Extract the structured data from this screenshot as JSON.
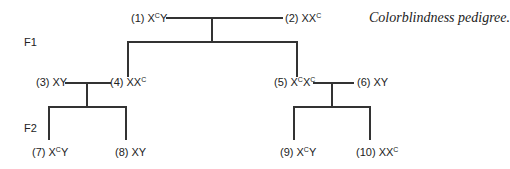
{
  "title": "Colorblindness pedigree.",
  "generations": {
    "f1": "F1",
    "f2": "F2"
  },
  "individuals": [
    {
      "num": "(1)",
      "base": "X",
      "sup": "C",
      "rest": "Y",
      "sup2": ""
    },
    {
      "num": "(2)",
      "base": "XX",
      "sup": "C",
      "rest": "",
      "sup2": ""
    },
    {
      "num": "(3)",
      "base": "XY",
      "sup": "",
      "rest": "",
      "sup2": ""
    },
    {
      "num": "(4)",
      "base": "XX",
      "sup": "C",
      "rest": "",
      "sup2": ""
    },
    {
      "num": "(5)",
      "base": "X",
      "sup": "C",
      "rest": "X",
      "sup2": "C"
    },
    {
      "num": "(6)",
      "base": "XY",
      "sup": "",
      "rest": "",
      "sup2": ""
    },
    {
      "num": "(7)",
      "base": "X",
      "sup": "C",
      "rest": "Y",
      "sup2": ""
    },
    {
      "num": "(8)",
      "base": "XY",
      "sup": "",
      "rest": "",
      "sup2": ""
    },
    {
      "num": "(9)",
      "base": "X",
      "sup": "C",
      "rest": "Y",
      "sup2": ""
    },
    {
      "num": "(10)",
      "base": "XX",
      "sup": "C",
      "rest": "",
      "sup2": ""
    }
  ]
}
